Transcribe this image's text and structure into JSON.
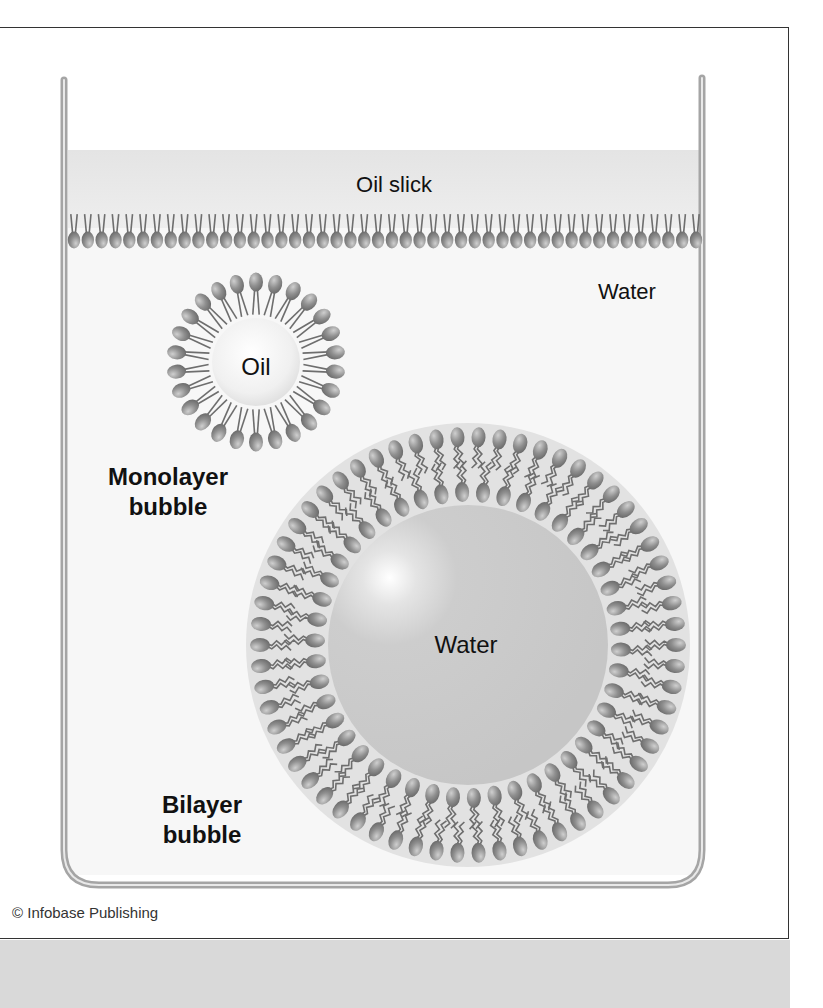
{
  "figure": {
    "labels": {
      "oil_slick": "Oil slick",
      "water_outer": "Water",
      "oil_core": "Oil",
      "water_core": "Water",
      "monolayer_line1": "Monolayer",
      "monolayer_line2": "bubble",
      "bilayer_line1": "Bilayer",
      "bilayer_line2": "bubble"
    },
    "credit": "© Infobase Publishing",
    "colors": {
      "head": "#8a8a8a",
      "head_highlight": "#c8c8c8",
      "tail": "#6e6e6e",
      "oil_slick_band": "#e6e6e6",
      "water_core": "#c9c9c9",
      "bilayer_ring": "#e2e2e2",
      "tank_wall": "#9a9a9a",
      "background_band": "#d9d9d9"
    },
    "structures": {
      "oil_slick_monolayer_heads": 46,
      "monolayer_bubble_heads": 26,
      "bilayer_outer_heads": 62,
      "bilayer_inner_heads": 46
    }
  }
}
